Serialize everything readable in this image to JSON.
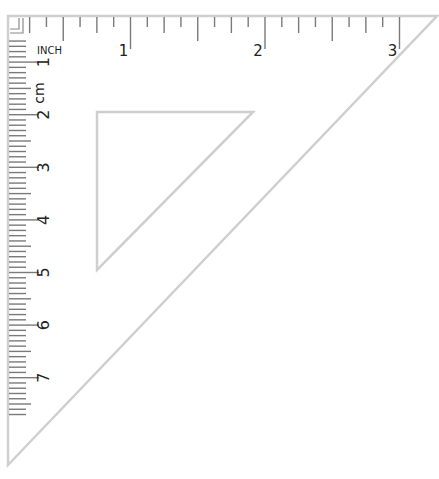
{
  "ruler": {
    "type": "45-degree set square",
    "top_scale": {
      "unit_label": "INCH",
      "major_labels": [
        "1",
        "2",
        "3"
      ],
      "subdivisions_per_unit": 8
    },
    "side_scale": {
      "unit_label": "cm",
      "major_labels": [
        "1",
        "2",
        "3",
        "4",
        "5",
        "6",
        "7"
      ],
      "subdivisions_per_unit": 10
    },
    "colors": {
      "edge": "#c8c8c8",
      "tick": "#7a7a7a",
      "label": "#222222",
      "background": "#ffffff"
    }
  }
}
